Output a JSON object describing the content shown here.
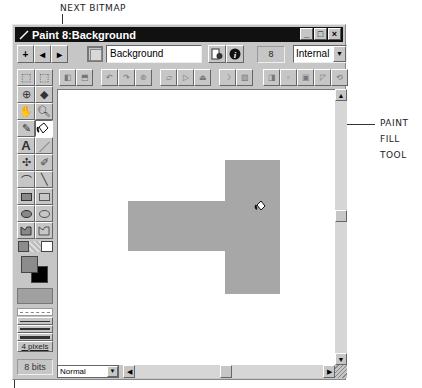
{
  "callouts": {
    "next_bitmap": "NEXT BITMAP",
    "paint_fill_tool": [
      "PAINT",
      "FILL",
      "TOOL"
    ]
  },
  "window": {
    "title": "Paint 8:Background",
    "controls": [
      "minimize",
      "maximize",
      "close"
    ],
    "control_glyphs": [
      "_",
      "□",
      "×"
    ]
  },
  "toolbar": {
    "nav_buttons": [
      {
        "name": "new-cast-member",
        "glyph": "+"
      },
      {
        "name": "previous-bitmap",
        "glyph": "◂"
      },
      {
        "name": "next-bitmap",
        "glyph": "▸"
      }
    ],
    "cast_member_name": "Background",
    "cast_member_number": "8",
    "cast_library": "Internal"
  },
  "effects_toolbar": {
    "buttons": [
      "flip-horizontal",
      "flip-vertical",
      "rotate-left",
      "rotate-right",
      "free-rotate",
      "skew",
      "warp",
      "perspective",
      "smooth",
      "trace-edges",
      "invert",
      "lighten",
      "darken",
      "fill",
      "switch-colors"
    ]
  },
  "tool_palette": {
    "tools": [
      "lasso",
      "marquee",
      "registration-point",
      "eraser",
      "hand",
      "magnifier",
      "eyedropper",
      "paint-bucket",
      "text",
      "pencil",
      "air-brush",
      "brush",
      "arc",
      "line",
      "filled-rectangle",
      "rectangle",
      "filled-ellipse",
      "ellipse",
      "filled-polygon",
      "polygon"
    ],
    "active_tool": "paint-bucket",
    "foreground_color": "#8c8c8c",
    "background_color": "#000000",
    "pattern_color": "#a0a0a0",
    "line_width_label": "4 pixels",
    "color_depth": "8 bits"
  },
  "canvas": {
    "shape_color": "#a7a7a7"
  },
  "statusbar": {
    "ink": "Normal"
  }
}
